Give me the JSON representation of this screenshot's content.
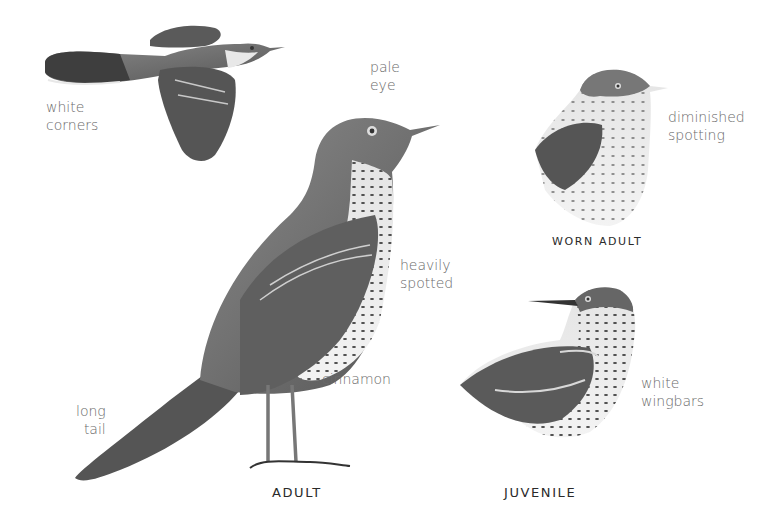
{
  "plate": {
    "subject": "Brown Thrasher-like bird field guide plate",
    "figures": [
      {
        "id": "flying",
        "caption": "",
        "labels": [
          {
            "lines": [
              "white",
              "corners"
            ]
          }
        ]
      },
      {
        "id": "adult",
        "caption": "ADULT",
        "labels": [
          {
            "lines": [
              "pale",
              "eye"
            ]
          },
          {
            "lines": [
              "heavily",
              "spotted"
            ]
          },
          {
            "lines": [
              "cinnamon"
            ]
          },
          {
            "lines": [
              "long",
              "tail"
            ]
          }
        ]
      },
      {
        "id": "worn-adult",
        "caption": "WORN ADULT",
        "labels": [
          {
            "lines": [
              "diminished",
              "spotting"
            ]
          }
        ]
      },
      {
        "id": "juvenile",
        "caption": "JUVENILE",
        "labels": [
          {
            "lines": [
              "white",
              "wingbars"
            ]
          }
        ]
      }
    ]
  },
  "labels": {
    "white_corners": [
      "white",
      "corners"
    ],
    "pale_eye": [
      "pale",
      "eye"
    ],
    "heavily_spotted": [
      "heavily",
      "spotted"
    ],
    "cinnamon": [
      "cinnamon"
    ],
    "long_tail": [
      "long",
      "tail"
    ],
    "diminished_spotting": [
      "diminished",
      "spotting"
    ],
    "white_wingbars": [
      "white",
      "wingbars"
    ]
  },
  "captions": {
    "adult": "ADULT",
    "worn_adult": "WORN ADULT",
    "juvenile": "JUVENILE"
  },
  "colors": {
    "background": "#ffffff",
    "label_text": "#6a6a6a",
    "caption_text": "#2a2a2a",
    "plumage_dark": "#4a4a4a",
    "plumage_mid": "#7a7a7a",
    "plumage_light": "#d8d8d8"
  }
}
